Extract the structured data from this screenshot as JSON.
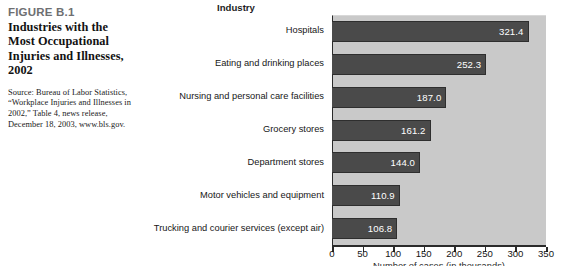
{
  "caption": {
    "figure_number": "FIGURE B.1",
    "title": "Industries with the Most Occupational Injuries and Illnesses, 2002",
    "source": "Source: Bureau of Labor Statistics, “Workplace Injuries and Illnesses in 2002,” Table 4, news release, December 18, 2003, www.bls.gov."
  },
  "chart_data": {
    "type": "bar",
    "orientation": "horizontal",
    "title": "Industry",
    "xlabel": "Number of cases (in thousands)",
    "ylabel": "Industry",
    "xlim": [
      0,
      350
    ],
    "ticks": [
      0,
      50,
      100,
      150,
      200,
      250,
      300,
      350
    ],
    "tick_labels": [
      "0",
      "50",
      "100",
      "150",
      "200",
      "250",
      "300",
      "350"
    ],
    "grid": false,
    "legend": "none",
    "categories": [
      "Hospitals",
      "Eating and drinking places",
      "Nursing and personal care facilities",
      "Grocery stores",
      "Department stores",
      "Motor vehicles and equipment",
      "Trucking and courier services (except air)"
    ],
    "values": [
      321.4,
      252.3,
      187.0,
      161.2,
      144.0,
      110.9,
      106.8
    ],
    "value_labels": [
      "321.4",
      "252.3",
      "187.0",
      "161.2",
      "144.0",
      "110.9",
      "106.8"
    ]
  },
  "colors": {
    "bar_fill": "#4a4a4a",
    "bar_stroke": "#2e2e2e",
    "plot_background": "#c9c9c9",
    "value_label": "#ffffff",
    "axis": "#2b2b2b",
    "figure_number": "#6e6f71",
    "page_background": "#ffffff"
  }
}
